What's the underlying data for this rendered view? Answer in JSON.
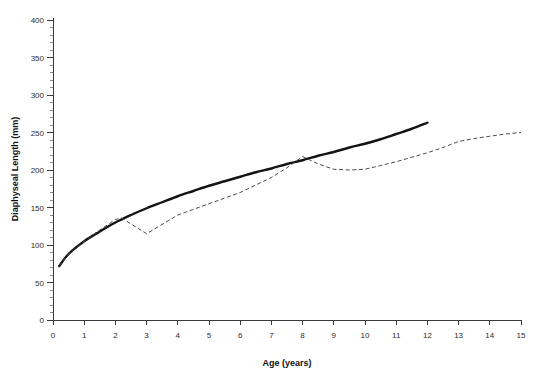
{
  "chart_data": {
    "type": "line",
    "title": "",
    "xlabel": "Age (years)",
    "ylabel": "Diaphyseal Length (mm)",
    "xlim": [
      0,
      15
    ],
    "ylim": [
      0,
      400
    ],
    "x_major_step": 1,
    "y_major_step": 50,
    "y_minor_step": 10,
    "grid": false,
    "legend": "none",
    "x_ticks": [
      "0",
      "1",
      "2",
      "3",
      "4",
      "5",
      "6",
      "7",
      "8",
      "9",
      "10",
      "11",
      "12",
      "13",
      "14",
      "15"
    ],
    "y_ticks": [
      "0",
      "50",
      "100",
      "150",
      "200",
      "250",
      "300",
      "350",
      "400"
    ],
    "series": [
      {
        "name": "reference-growth-curve",
        "style": "solid",
        "color": "#141414",
        "x": [
          0.2,
          0.5,
          1.0,
          1.5,
          2.0,
          2.5,
          3.0,
          3.5,
          4.0,
          4.5,
          5.0,
          5.5,
          6.0,
          6.5,
          7.0,
          7.5,
          8.0,
          8.5,
          9.0,
          9.5,
          10.0,
          10.5,
          11.0,
          11.5,
          12.0
        ],
        "y": [
          72,
          88,
          105,
          118,
          130,
          140,
          149,
          157,
          165,
          172,
          179,
          185,
          191,
          197,
          202,
          208,
          213,
          219,
          224,
          230,
          235,
          241,
          248,
          255,
          263
        ]
      },
      {
        "name": "individual-specimen-curve",
        "style": "dashed",
        "color": "#4a4a4a",
        "x": [
          0.2,
          0.5,
          1.0,
          1.5,
          2.0,
          2.2,
          3.0,
          4.0,
          5.0,
          6.0,
          7.0,
          7.5,
          8.0,
          8.5,
          9.0,
          9.5,
          10.0,
          10.5,
          11.0,
          11.5,
          12.0,
          12.5,
          13.0,
          13.5,
          14.0,
          14.5,
          15.0
        ],
        "y": [
          72,
          88,
          105,
          120,
          134,
          136,
          115,
          140,
          155,
          170,
          190,
          203,
          218,
          208,
          201,
          200,
          201,
          206,
          211,
          217,
          223,
          230,
          238,
          242,
          245,
          248,
          250
        ]
      }
    ]
  }
}
